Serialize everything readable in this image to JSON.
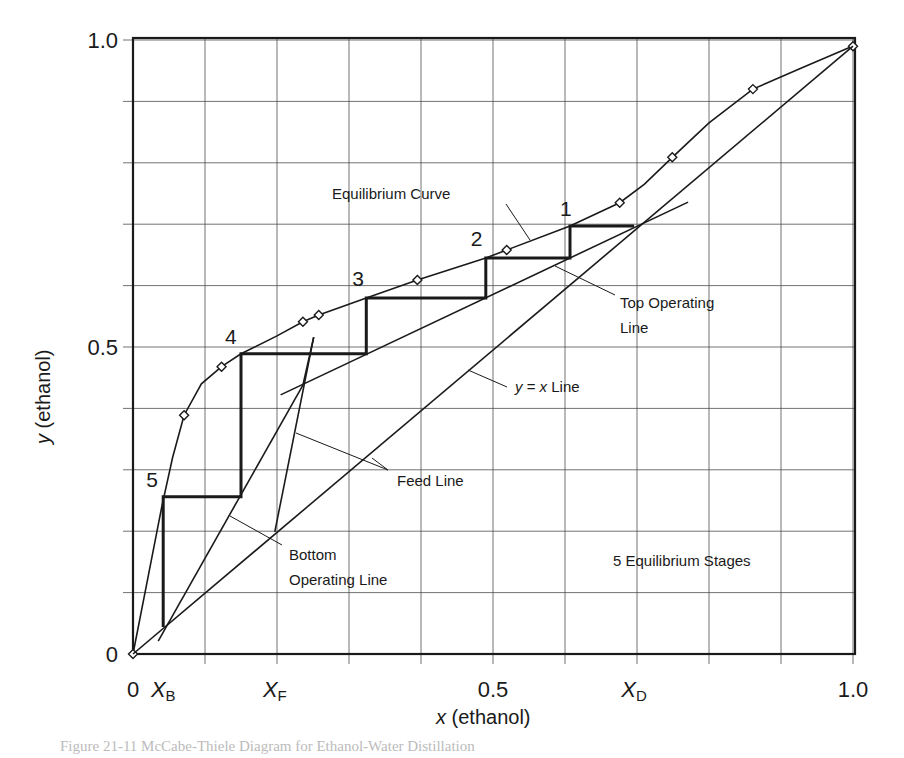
{
  "chart_data": {
    "type": "line",
    "xlabel_var": "x",
    "xlabel_rest": " (ethanol)",
    "ylabel_var": "y",
    "ylabel_rest": " (ethanol)",
    "xlim": [
      0,
      1.0
    ],
    "ylim": [
      0,
      1.0
    ],
    "grid": true,
    "grid_step": 0.1,
    "x_ticks": [
      {
        "value": 0,
        "label": "0"
      },
      {
        "value": 0.042,
        "label": "X",
        "sub": "B"
      },
      {
        "value": 0.197,
        "label": "X",
        "sub": "F"
      },
      {
        "value": 0.5,
        "label": "0.5"
      },
      {
        "value": 0.696,
        "label": "X",
        "sub": "D"
      },
      {
        "value": 1.0,
        "label": "1.0"
      }
    ],
    "y_ticks": [
      {
        "value": 0,
        "label": "0"
      },
      {
        "value": 0.5,
        "label": "0.5"
      },
      {
        "value": 1.0,
        "label": "1.0"
      }
    ],
    "compositions": {
      "XB": 0.042,
      "XF": 0.197,
      "XD": 0.696
    },
    "series": [
      {
        "name": "Equilibrium Curve",
        "marker": "diamond",
        "points": [
          [
            0,
            0
          ],
          [
            0.071,
            0.389
          ],
          [
            0.123,
            0.468
          ],
          [
            0.236,
            0.541
          ],
          [
            0.258,
            0.552
          ],
          [
            0.395,
            0.609
          ],
          [
            0.519,
            0.658
          ],
          [
            0.676,
            0.735
          ],
          [
            0.749,
            0.809
          ],
          [
            0.861,
            0.92
          ],
          [
            1.0,
            0.99
          ]
        ],
        "curve": [
          [
            0,
            0
          ],
          [
            0.02,
            0.12
          ],
          [
            0.04,
            0.24
          ],
          [
            0.055,
            0.32
          ],
          [
            0.071,
            0.389
          ],
          [
            0.095,
            0.44
          ],
          [
            0.123,
            0.468
          ],
          [
            0.15,
            0.489
          ],
          [
            0.2,
            0.518
          ],
          [
            0.236,
            0.541
          ],
          [
            0.258,
            0.552
          ],
          [
            0.324,
            0.58
          ],
          [
            0.395,
            0.609
          ],
          [
            0.49,
            0.645
          ],
          [
            0.519,
            0.658
          ],
          [
            0.607,
            0.697
          ],
          [
            0.676,
            0.735
          ],
          [
            0.71,
            0.765
          ],
          [
            0.749,
            0.809
          ],
          [
            0.8,
            0.865
          ],
          [
            0.861,
            0.92
          ],
          [
            0.93,
            0.955
          ],
          [
            1.0,
            0.99
          ]
        ]
      },
      {
        "name": "y = x Line",
        "points": [
          [
            0,
            0
          ],
          [
            1.0,
            0.99
          ]
        ]
      },
      {
        "name": "Top Operating Line",
        "points": [
          [
            0.205,
            0.422
          ],
          [
            0.771,
            0.736
          ]
        ]
      },
      {
        "name": "Bottom Operating Line",
        "points": [
          [
            0.035,
            0.021
          ],
          [
            0.236,
            0.438
          ]
        ]
      },
      {
        "name": "Feed Line",
        "points": [
          [
            0.197,
            0.199
          ],
          [
            0.251,
            0.516
          ]
        ]
      },
      {
        "name": "Feed Line (upper extension)",
        "points": [
          [
            0.236,
            0.438
          ],
          [
            0.251,
            0.516
          ]
        ]
      },
      {
        "name": "Steps",
        "points": [
          [
            0.696,
            0.697
          ],
          [
            0.607,
            0.697
          ],
          [
            0.607,
            0.645
          ],
          [
            0.49,
            0.645
          ],
          [
            0.49,
            0.58
          ],
          [
            0.324,
            0.58
          ],
          [
            0.324,
            0.489
          ],
          [
            0.15,
            0.489
          ],
          [
            0.15,
            0.256
          ],
          [
            0.042,
            0.256
          ],
          [
            0.042,
            0.044
          ]
        ]
      }
    ],
    "stages": [
      {
        "n": "1",
        "x": 0.607,
        "y": 0.697
      },
      {
        "n": "2",
        "x": 0.49,
        "y": 0.645
      },
      {
        "n": "3",
        "x": 0.324,
        "y": 0.58
      },
      {
        "n": "4",
        "x": 0.15,
        "y": 0.489
      },
      {
        "n": "5",
        "x": 0.042,
        "y": 0.256
      }
    ],
    "annotations": {
      "equilibrium_curve": "Equilibrium Curve",
      "top_operating_line_1": "Top Operating",
      "top_operating_line_2": "Line",
      "yx_line_var1": "y",
      "yx_line_eq": " = ",
      "yx_line_var2": "x",
      "yx_line_rest": " Line",
      "feed_line": "Feed Line",
      "bottom_operating_line_1": "Bottom",
      "bottom_operating_line_2": "Operating Line",
      "stage_count": "5 Equilibrium Stages"
    }
  },
  "caption": "Figure 21-11  McCabe-Thiele Diagram for Ethanol-Water Distillation"
}
